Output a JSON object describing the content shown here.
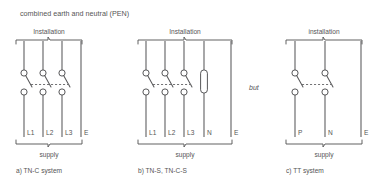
{
  "title": "combined earth and neutral (PEN)",
  "connector": "but",
  "labels": {
    "supply": "supply"
  },
  "panels": [
    {
      "id": "tn-c",
      "heading": "Installation",
      "supply_label": "supply",
      "caption": "a) TN-C system",
      "terminals": [
        "L1",
        "L2",
        "L3",
        "E"
      ],
      "switched_poles": [
        "L1",
        "L2",
        "L3"
      ],
      "unswitched_poles": [
        "E"
      ],
      "link_poles": []
    },
    {
      "id": "tn-s",
      "heading": "Installation",
      "supply_label": "supply",
      "caption": "b) TN-S, TN-C-S",
      "terminals": [
        "L1",
        "L2",
        "L3",
        "N",
        "E"
      ],
      "switched_poles": [
        "L1",
        "L2",
        "L3"
      ],
      "unswitched_poles": [
        "E"
      ],
      "link_poles": [
        "N"
      ]
    },
    {
      "id": "tt",
      "heading": "installation",
      "supply_label": "supply",
      "caption": "c) TT system",
      "terminals": [
        "P",
        "N",
        "E"
      ],
      "switched_poles": [
        "P",
        "N"
      ],
      "unswitched_poles": [
        "E"
      ],
      "link_poles": []
    }
  ],
  "colors": {
    "line": "#58585a",
    "text": "#555555",
    "background": "#ffffff"
  }
}
